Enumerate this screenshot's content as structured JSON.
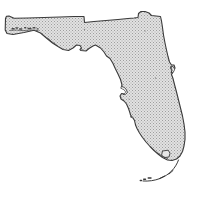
{
  "document": {
    "title": "Florida State Outline Map",
    "subject": "Florida",
    "kind": "state-outline-map",
    "background_color": "#ffffff",
    "canvas_width": 199,
    "canvas_height": 207
  },
  "map": {
    "name": "Florida",
    "projection_note": "simple state silhouette",
    "land_fill_color": "#d8d8d8",
    "land_fill_texture": "halftone-stipple",
    "stipple_dot_color": "#9a9a9a",
    "outline_color": "#3a3a3a",
    "outline_width_px": 1.1,
    "interior_feature_color": "#4a4a4a",
    "label_visible": false,
    "labels": [],
    "features": [
      {
        "name": "mainland",
        "kind": "landmass",
        "description": "Florida peninsula and panhandle silhouette"
      },
      {
        "name": "panhandle-western-tip",
        "kind": "coastal-region",
        "description": "Narrow western end of the panhandle near Pensacola"
      },
      {
        "name": "northern-border",
        "kind": "political-border",
        "description": "Straight Alabama and Georgia boundary along the top"
      },
      {
        "name": "northeast-notch",
        "kind": "political-border",
        "description": "St. Marys River step at the northeast corner"
      },
      {
        "name": "big-bend",
        "kind": "coastal-region",
        "description": "Concave Gulf coast curve where panhandle meets peninsula"
      },
      {
        "name": "tampa-bay",
        "kind": "bay",
        "description": "Gulf coast indentation roughly midway down the peninsula"
      },
      {
        "name": "charlotte-harbor",
        "kind": "bay",
        "description": "Smaller Gulf coast inlet south of Tampa Bay"
      },
      {
        "name": "cape-canaveral",
        "kind": "cape",
        "description": "Small Atlantic coast protrusion on the east side"
      },
      {
        "name": "lake-okeechobee",
        "kind": "lake",
        "description": "Outlined inland lake in the southern peninsula"
      },
      {
        "name": "southern-tip",
        "kind": "coastal-region",
        "description": "Everglades and Florida Bay at the peninsula's south end"
      },
      {
        "name": "florida-keys",
        "kind": "island-chain",
        "description": "Arc of islands curving southwest from the southern tip"
      },
      {
        "name": "panhandle-barrier-islands",
        "kind": "island-chain",
        "description": "Small barrier island marks along the panhandle Gulf shore"
      }
    ]
  }
}
